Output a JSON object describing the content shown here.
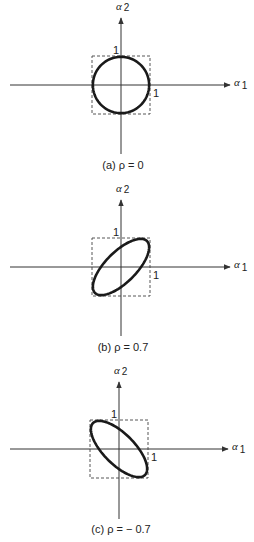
{
  "panels": [
    {
      "id": "a",
      "caption": "(a) ρ = 0",
      "rho": 0,
      "x_axis_label": "α",
      "x_axis_sub": "1",
      "y_axis_label": "α",
      "y_axis_sub": "2",
      "tick_x": "1",
      "tick_y": "1",
      "origin": [
        121,
        85
      ],
      "half": 29,
      "x_axis_range": [
        10,
        230
      ],
      "y_axis_range": [
        18,
        154
      ],
      "caption_y": 169
    },
    {
      "id": "b",
      "caption": "(b) ρ = 0.7",
      "rho": 0.7,
      "x_axis_label": "α",
      "x_axis_sub": "1",
      "y_axis_label": "α",
      "y_axis_sub": "2",
      "tick_x": "1",
      "tick_y": "1",
      "origin": [
        121,
        267
      ],
      "half": 29,
      "x_axis_range": [
        10,
        230
      ],
      "y_axis_range": [
        200,
        336
      ],
      "caption_y": 351
    },
    {
      "id": "c",
      "caption": "(c) ρ = − 0.7",
      "rho": -0.7,
      "x_axis_label": "α",
      "x_axis_sub": "1",
      "y_axis_label": "α",
      "y_axis_sub": "2",
      "tick_x": "1",
      "tick_y": "1",
      "origin": [
        119,
        449
      ],
      "half": 29,
      "x_axis_range": [
        10,
        228
      ],
      "y_axis_range": [
        382,
        519
      ],
      "caption_y": 533
    }
  ],
  "colors": {
    "ink": "#1a1a1a",
    "axis": "#333333",
    "dashed_box": "#444444",
    "background": "#ffffff"
  }
}
